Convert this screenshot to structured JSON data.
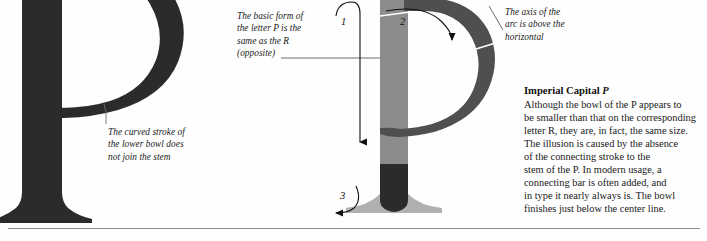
{
  "page": {
    "background": "#fefefe",
    "rule_color": "#8d8d8d"
  },
  "specimen": {
    "letter": "P",
    "name": "imperial-capital-p-specimen",
    "fill": "#2b2b2b"
  },
  "diagram": {
    "letter": "P",
    "stem_fill": "#8c8c8c",
    "bowl_fill": "#4f4f4f",
    "foot_fill": "#2b2b2b",
    "serif_fill": "#b0b0b0",
    "axis_line_color": "#ffffff"
  },
  "callouts": {
    "lower_bowl": {
      "lines": [
        "The curved stroke of",
        "the lower bowl does",
        "not join the stem"
      ]
    },
    "basic_form": {
      "lines": [
        "The basic form of",
        "the letter P is the",
        "same as the R",
        "(opposite)"
      ]
    },
    "axis": {
      "lines": [
        "The axis of the",
        "arc is above the",
        "horizontal"
      ]
    }
  },
  "stroke_order": {
    "one": "1",
    "two": "2",
    "three": "3"
  },
  "copy": {
    "title_text": "Imperial Capital ",
    "title_letter": "P",
    "body_lines": [
      "Although the bowl of the P appears to",
      "be smaller than that on the corresponding",
      "letter R, they are, in fact, the same size.",
      "The illusion is caused by the absence",
      "of the connecting stroke to the",
      "stem of the P. In modern usage, a",
      "connecting bar is often added, and",
      "in type it nearly always is. The bowl",
      "finishes just below the center line."
    ]
  }
}
